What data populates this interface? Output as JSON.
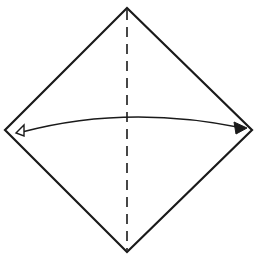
{
  "diagram": {
    "type": "origami-fold-step",
    "colors": {
      "background": "#ffffff",
      "stroke": "#1a1a1a"
    },
    "paper": {
      "shape": "diamond",
      "vertices": {
        "top": [
          127,
          8
        ],
        "right": [
          252,
          130
        ],
        "bottom": [
          127,
          252
        ],
        "left": [
          5,
          130
        ]
      }
    },
    "fold_line": {
      "style": "dashed",
      "kind": "valley-fold",
      "from": [
        127,
        10
      ],
      "to": [
        127,
        250
      ]
    },
    "arrow": {
      "kind": "fold-direction",
      "start": [
        20,
        132
      ],
      "control": [
        127,
        105
      ],
      "end": [
        245,
        128
      ],
      "start_head": "hollow",
      "end_head": "filled"
    }
  }
}
